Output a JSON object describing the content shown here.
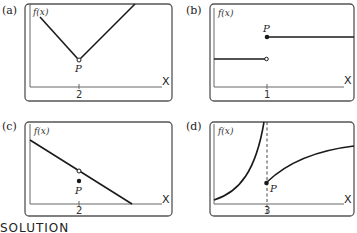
{
  "figure": {
    "panels": [
      {
        "id": "a",
        "label": "(a)",
        "y_axis_label": "f(x)",
        "x_axis_label": "X",
        "tick_label": "2",
        "point_label": "P",
        "description": "V-shaped graph with open circle at vertex x=2"
      },
      {
        "id": "b",
        "label": "(b)",
        "y_axis_label": "f(x)",
        "x_axis_label": "X",
        "tick_label": "1",
        "point_label": "P",
        "description": "Step function: lower segment ends with open circle at x=1, upper segment starts with filled dot P at x=1"
      },
      {
        "id": "c",
        "label": "(c)",
        "y_axis_label": "f(x)",
        "x_axis_label": "X",
        "tick_label": "2",
        "point_label": "P",
        "description": "Decreasing line with open circle at x=2 and filled point P below it"
      },
      {
        "id": "d",
        "label": "(d)",
        "y_axis_label": "f(x)",
        "x_axis_label": "X",
        "tick_label": "3",
        "point_label": "P",
        "description": "Vertical asymptote (dashed) at x=3; left branch rises to infinity; right branch starts at filled dot P and increases concave down"
      }
    ],
    "footer_text": "SOLUTION",
    "colors": {
      "line": "#1a1a1a",
      "frame": "#555555",
      "axis": "#666666"
    }
  }
}
